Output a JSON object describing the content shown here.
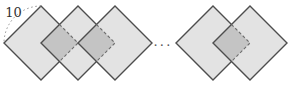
{
  "figure": {
    "label_side": "10",
    "ellipsis": "...",
    "colors": {
      "background": "#ffffff",
      "square_fill": "#e3e3e3",
      "overlap_fill": "#c4c4c4",
      "outline": "#4d4d4d",
      "hidden_edge": "#6e6e6e",
      "leader": "#8a8a8a",
      "text": "#333333",
      "ellipsis_text": "#555555"
    },
    "geometry": {
      "half_diagonal": 37,
      "center_y": 43,
      "left_group_centers_x": [
        41,
        78,
        115
      ],
      "right_group_centers_x": [
        213,
        250
      ],
      "label_x": 13.5,
      "label_y": 16.5,
      "ellipsis_x": 163,
      "ellipsis_y": 46,
      "outline_width": 1.4,
      "hidden_dash": "3 2.3",
      "leader_dash": "1.6 2.6"
    }
  }
}
